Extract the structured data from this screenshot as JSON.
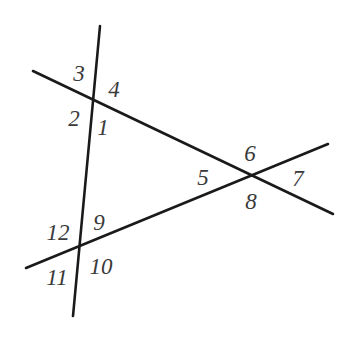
{
  "figure": {
    "background_color": "#ffffff",
    "stroke_color": "#1a1a1a",
    "label_color": "#3a3a3a",
    "stroke_width": 2.6,
    "width": 349,
    "height": 343
  },
  "vertices": [
    {
      "name": "upper-left-intersection",
      "x": 95,
      "y": 102
    },
    {
      "name": "right-intersection",
      "x": 250,
      "y": 180
    },
    {
      "name": "lower-left-intersection",
      "x": 78,
      "y": 247
    }
  ],
  "lines": [
    {
      "name": "steep-vertical-line",
      "x1": 100,
      "y1": 26,
      "x2": 73,
      "y2": 316
    },
    {
      "name": "upper-descending-line",
      "x1": 33,
      "y1": 71,
      "x2": 333,
      "y2": 214
    },
    {
      "name": "lower-ascending-line",
      "x1": 26,
      "y1": 268,
      "x2": 328,
      "y2": 144
    }
  ],
  "labels": [
    {
      "id": "1",
      "text": "1",
      "x": 103,
      "y": 127
    },
    {
      "id": "2",
      "text": "2",
      "x": 74,
      "y": 118
    },
    {
      "id": "3",
      "text": "3",
      "x": 79,
      "y": 73
    },
    {
      "id": "4",
      "text": "4",
      "x": 114,
      "y": 89
    },
    {
      "id": "5",
      "text": "5",
      "x": 203,
      "y": 177
    },
    {
      "id": "6",
      "text": "6",
      "x": 250,
      "y": 153
    },
    {
      "id": "7",
      "text": "7",
      "x": 298,
      "y": 178
    },
    {
      "id": "8",
      "text": "8",
      "x": 251,
      "y": 201
    },
    {
      "id": "9",
      "text": "9",
      "x": 99,
      "y": 222
    },
    {
      "id": "10",
      "text": "10",
      "x": 101,
      "y": 266
    },
    {
      "id": "11",
      "text": "11",
      "x": 57,
      "y": 277
    },
    {
      "id": "12",
      "text": "12",
      "x": 58,
      "y": 232
    }
  ]
}
